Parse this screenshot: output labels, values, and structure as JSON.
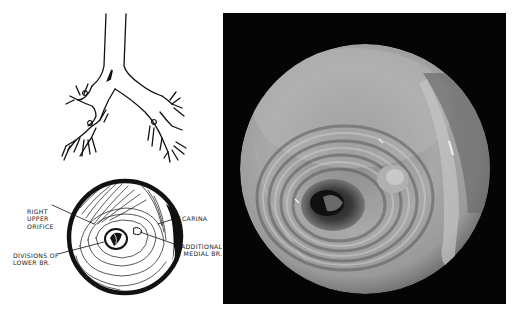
{
  "figure": {
    "diagram_tree": {
      "description": "Line drawing of trachea and bronchial tree with arrow marking viewpoint",
      "arrow_icon": "arrow-down-icon"
    },
    "diagram_endoscopic_view": {
      "labels": {
        "right_upper_orifice": [
          "RIGHT",
          "UPPER",
          "ORIFICE"
        ],
        "divisions_of_lower_br": [
          "DIVISIONS OF",
          "LOWER BR."
        ],
        "carina": "CARINA",
        "additional_medial_br": [
          "ADDITIONAL",
          "MEDIAL BR."
        ]
      }
    },
    "photograph": {
      "description": "Bronchoscopic photograph of bronchial lumen",
      "background_color": "#050505"
    }
  }
}
